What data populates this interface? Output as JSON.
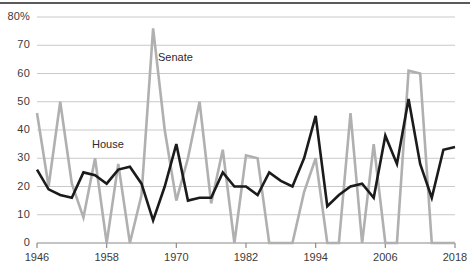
{
  "chart_data": {
    "type": "line",
    "title": "",
    "subtitle": "",
    "xlabel": "",
    "ylabel": "",
    "xlim": [
      1946,
      2018
    ],
    "ylim": [
      0,
      80
    ],
    "grid": true,
    "grid_axis": "y",
    "legend_position": "inline-annotation",
    "x": [
      1946,
      1948,
      1950,
      1952,
      1954,
      1956,
      1958,
      1960,
      1962,
      1964,
      1966,
      1968,
      1970,
      1972,
      1974,
      1976,
      1978,
      1980,
      1982,
      1984,
      1986,
      1988,
      1990,
      1992,
      1994,
      1996,
      1998,
      2000,
      2002,
      2004,
      2006,
      2008,
      2010,
      2012,
      2014,
      2016,
      2018
    ],
    "ytick_labels": [
      "0",
      "10",
      "20",
      "30",
      "40",
      "50",
      "60",
      "70",
      "80%"
    ],
    "ytick_values": [
      0,
      10,
      20,
      30,
      40,
      50,
      60,
      70,
      80
    ],
    "xtick_labels": [
      "1946",
      "1958",
      "1970",
      "1982",
      "1994",
      "2006",
      "2018"
    ],
    "xtick_values": [
      1946,
      1958,
      1970,
      1982,
      1994,
      2006,
      2018
    ],
    "series": [
      {
        "name": "House",
        "color": "#1b1b1b",
        "width": 2.6,
        "values": [
          26,
          19,
          17,
          16,
          25,
          24,
          21,
          26,
          27,
          21,
          8,
          20,
          35,
          15,
          16,
          16,
          25,
          20,
          20,
          17,
          25,
          22,
          20,
          30,
          45,
          13,
          17,
          20,
          21,
          16,
          38,
          28,
          51,
          28,
          16,
          33,
          34
        ]
      },
      {
        "name": "Senate",
        "color": "#b0b0b0",
        "width": 2.6,
        "values": [
          46,
          20,
          50,
          21,
          9,
          30,
          0,
          28,
          0,
          17,
          76,
          40,
          15,
          30,
          50,
          14,
          33,
          0,
          31,
          30,
          0,
          0,
          0,
          18,
          30,
          0,
          0,
          46,
          0,
          35,
          0,
          0,
          61,
          60,
          0,
          0,
          0
        ]
      }
    ],
    "annotations": [
      {
        "text": "Senate",
        "x_px": 158,
        "y_px": 52
      },
      {
        "text": "House",
        "x_px": 92,
        "y_px": 139
      }
    ]
  },
  "axis": {
    "y_axis_name": "percent-axis",
    "x_axis_name": "year-axis"
  }
}
